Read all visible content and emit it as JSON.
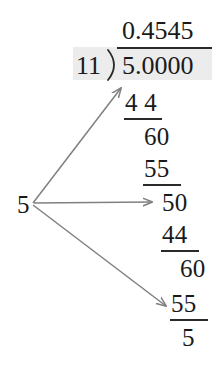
{
  "figure": {
    "kind": "long-division-worked-example",
    "text_color": "#1a1a1a",
    "arrow_color": "#808080",
    "highlight_color": "#ececed",
    "background_color": "#ffffff"
  },
  "division": {
    "quotient": "0.4545",
    "divisor": "11",
    "dividend": "5.0000",
    "bracket_symbol": ")"
  },
  "left_label": {
    "value": "5"
  },
  "steps": [
    {
      "id": "step-1-product",
      "value": "4 4"
    },
    {
      "id": "step-1-remainder",
      "value": "60"
    },
    {
      "id": "step-2-product",
      "value": "55"
    },
    {
      "id": "step-2-remainder",
      "value": "50"
    },
    {
      "id": "step-3-product",
      "value": "44"
    },
    {
      "id": "step-3-remainder",
      "value": "60"
    },
    {
      "id": "step-4-product",
      "value": "55"
    },
    {
      "id": "step-4-remainder",
      "value": "5"
    }
  ],
  "arrows": [
    {
      "id": "arrow-to-dividend",
      "from": "5",
      "to": "5.0000"
    },
    {
      "id": "arrow-to-remainder-50",
      "from": "5",
      "to": "50"
    },
    {
      "id": "arrow-to-remainder-5",
      "from": "5",
      "to": "5"
    }
  ]
}
